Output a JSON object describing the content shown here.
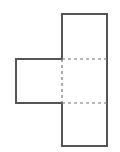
{
  "diagram": {
    "type": "net-of-squares",
    "stroke_color": "#555555",
    "dash_color": "#777777",
    "background": "#ffffff",
    "faces": [
      {
        "name": "top-square",
        "x": 62,
        "y": 14,
        "w": 45,
        "h": 45
      },
      {
        "name": "middle-square",
        "x": 62,
        "y": 59,
        "w": 45,
        "h": 44
      },
      {
        "name": "left-square",
        "x": 16,
        "y": 59,
        "w": 46,
        "h": 44
      },
      {
        "name": "bottom-square",
        "x": 62,
        "y": 103,
        "w": 45,
        "h": 43
      }
    ],
    "fold_lines": [
      {
        "name": "fold-top",
        "x1": 62,
        "y1": 59,
        "x2": 107,
        "y2": 59
      },
      {
        "name": "fold-bottom",
        "x1": 62,
        "y1": 103,
        "x2": 107,
        "y2": 103
      },
      {
        "name": "fold-left",
        "x1": 62,
        "y1": 59,
        "x2": 62,
        "y2": 103
      }
    ]
  }
}
